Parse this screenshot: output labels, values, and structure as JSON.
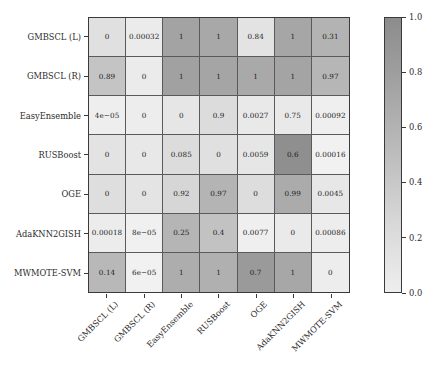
{
  "chart_data": {
    "type": "heatmap",
    "title": "",
    "xlabel": "",
    "ylabel": "",
    "grid": false,
    "legend_position": "right",
    "colorbar": {
      "label": "",
      "ticks": [
        "0.0",
        "0.2",
        "0.4",
        "0.6",
        "0.8",
        "1.0"
      ],
      "tick_values": [
        0.0,
        0.2,
        0.4,
        0.6,
        0.8,
        1.0
      ],
      "vmin": 0.0,
      "vmax": 1.0,
      "colormap": "greys",
      "low_color": "#eeeeee",
      "high_color": "#8c8c8c"
    },
    "categories": [
      "GMBSCL (L)",
      "GMBSCL (R)",
      "EasyEnsemble",
      "RUSBoost",
      "OGE",
      "AdaKNN2GISH",
      "MWMOTE-SVM"
    ],
    "row_labels": [
      "GMBSCL (L)",
      "GMBSCL (R)",
      "EasyEnsemble",
      "RUSBoost",
      "OGE",
      "AdaKNN2GISH",
      "MWMOTE-SVM"
    ],
    "column_labels": [
      "GMBSCL (L)",
      "GMBSCL (R)",
      "EasyEnsemble",
      "RUSBoost",
      "OGE",
      "AdaKNN2GISH",
      "MWMOTE-SVM"
    ],
    "cell_text": [
      [
        "0",
        "0.00032",
        "1",
        "1",
        "0.84",
        "1",
        "0.31"
      ],
      [
        "0.89",
        "0",
        "1",
        "1",
        "1",
        "1",
        "0.97"
      ],
      [
        "4e−05",
        "0",
        "0",
        "0.9",
        "0.0027",
        "0.75",
        "0.00092"
      ],
      [
        "0",
        "0",
        "0.085",
        "0",
        "0.0059",
        "0.6",
        "0.00016"
      ],
      [
        "0",
        "0",
        "0.92",
        "0.97",
        "0",
        "0.99",
        "0.0045"
      ],
      [
        "0.00018",
        "8e−05",
        "0.25",
        "0.4",
        "0.0077",
        "0",
        "0.00086"
      ],
      [
        "0.14",
        "6e−05",
        "1",
        "1",
        "0.7",
        "1",
        "0"
      ]
    ],
    "values": [
      [
        0,
        0.00032,
        1,
        1,
        0.84,
        1,
        0.31
      ],
      [
        0.89,
        0,
        1,
        1,
        1,
        1,
        0.97
      ],
      [
        4e-05,
        0,
        0,
        0.9,
        0.0027,
        0.75,
        0.00092
      ],
      [
        0,
        0,
        0.085,
        0,
        0.0059,
        0.6,
        0.00016
      ],
      [
        0,
        0,
        0.92,
        0.97,
        0,
        0.99,
        0.0045
      ],
      [
        0.00018,
        8e-05,
        0.25,
        0.4,
        0.0077,
        0,
        0.00086
      ],
      [
        0.14,
        6e-05,
        1,
        1,
        0.7,
        1,
        0
      ]
    ],
    "cell_colors": [
      [
        "#e0e0e0",
        "#ebebeb",
        "#a3a3a3",
        "#a8a8a8",
        "#e3e3e3",
        "#a6a6a6",
        "#b3b3b3"
      ],
      [
        "#c4c4c4",
        "#ebebeb",
        "#a1a1a1",
        "#a5a5a5",
        "#a9a9a9",
        "#a4a4a4",
        "#b6b6b6"
      ],
      [
        "#eeeeee",
        "#ededed",
        "#e6e6e6",
        "#dcdcdc",
        "#e9e9e9",
        "#e9e9e9",
        "#efefef"
      ],
      [
        "#e3e3e3",
        "#e8e8e8",
        "#dcdcdc",
        "#e0e0e0",
        "#e6e6e6",
        "#8f8f8f",
        "#f1f1f1"
      ],
      [
        "#dedede",
        "#e4e4e4",
        "#d6d6d6",
        "#b4b4b4",
        "#dddddd",
        "#ababab",
        "#e7e7e7"
      ],
      [
        "#ececec",
        "#f0f0f0",
        "#b5b5b5",
        "#c2c2c2",
        "#efefef",
        "#eaeaea",
        "#ededed"
      ],
      [
        "#b8b8b8",
        "#f1f1f1",
        "#adadad",
        "#b0b0b0",
        "#9a9a9a",
        "#a7a7a7",
        "#ededed"
      ]
    ]
  },
  "axis": {
    "tick_color": "#3a3a3a",
    "frame_color": "#3a3a3a"
  }
}
